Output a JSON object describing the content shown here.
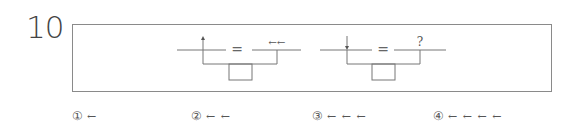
{
  "question": {
    "number": "10"
  },
  "diagram": {
    "left_group": {
      "top_left_mark": "up-arrow",
      "equals": "=",
      "top_right_label": "←←"
    },
    "right_group": {
      "top_left_mark": "down-arrow",
      "equals": "=",
      "top_right_label": "?"
    },
    "colors": {
      "line": "#777777",
      "border": "#8a8a8a"
    }
  },
  "options": [
    {
      "num": "①",
      "arrows": "←"
    },
    {
      "num": "②",
      "arrows": "← ←"
    },
    {
      "num": "③",
      "arrows": "← ← ←"
    },
    {
      "num": "④",
      "arrows": "← ← ← ←"
    }
  ]
}
